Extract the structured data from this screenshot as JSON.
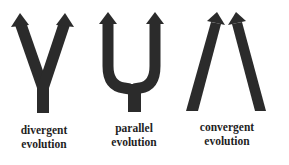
{
  "diagram": {
    "arrow_color": "#2b2b2b",
    "background": "#ffffff",
    "panels": [
      {
        "id": "divergent",
        "shape": "Y-shaped arrow: single stem splitting into two arrows that spread apart",
        "label_line1": "divergent",
        "label_line2": "evolution"
      },
      {
        "id": "parallel",
        "shape": "U/fork-shaped arrow: single stem splitting into two parallel upward arrows",
        "label_line1": "parallel",
        "label_line2": "evolution"
      },
      {
        "id": "convergent",
        "shape": "Two separate arrows starting apart and pointing toward each other at the top",
        "label_line1": "convergent",
        "label_line2": "evolution"
      }
    ]
  }
}
